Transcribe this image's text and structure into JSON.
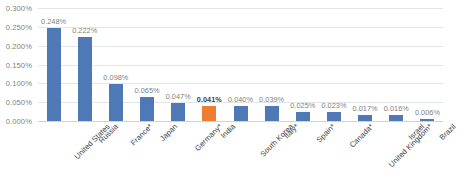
{
  "chart_data": {
    "type": "bar",
    "title": "",
    "xlabel": "",
    "ylabel": "",
    "ylim": [
      0,
      0.3
    ],
    "grid": true,
    "legend": "none",
    "y_ticks": [
      "0.000%",
      "0.050%",
      "0.100%",
      "0.150%",
      "0.200%",
      "0.250%",
      "0.300%"
    ],
    "y_tick_values": [
      0.0,
      0.05,
      0.1,
      0.15,
      0.2,
      0.25,
      0.3
    ],
    "categories": [
      "United States",
      "Russia",
      "France*",
      "Japan",
      "Germany*",
      "India",
      "South Korea",
      "Italy*",
      "Spain*",
      "Canada*",
      "United Kingdom*",
      "Israel",
      "Brazil"
    ],
    "values": [
      0.248,
      0.222,
      0.098,
      0.065,
      0.047,
      0.041,
      0.04,
      0.039,
      0.025,
      0.023,
      0.017,
      0.016,
      0.006
    ],
    "value_labels": [
      "0.248%",
      "0.222%",
      "0.098%",
      "0.065%",
      "0.047%",
      "0.041%",
      "0.040%",
      "0.039%",
      "0.025%",
      "0.023%",
      "0.017%",
      "0.016%",
      "0.006%"
    ],
    "highlight_index": 5,
    "colors": {
      "bar": "#4e79b6",
      "highlight": "#ed7d31",
      "gridline": "#e2e6ea",
      "axis": "#cdd3d9",
      "tick_text": "#7f7f7f",
      "category_text": "#404040",
      "emphasis_text": "#3f3f3f",
      "background": "#ffffff"
    }
  }
}
